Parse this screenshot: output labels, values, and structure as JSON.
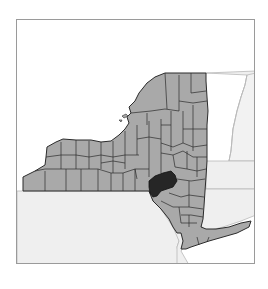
{
  "map": {
    "title": "New York State counties locator map",
    "state": "New York",
    "highlighted_region": "Delaware County",
    "neighbor_regions": [
      "Pennsylvania",
      "New Jersey",
      "Vermont",
      "Massachusetts",
      "Connecticut"
    ],
    "colors": {
      "background": "#ffffff",
      "frame_border": "#9a9a9a",
      "state_fill": "#a9a9a9",
      "county_border": "#2b2b2b",
      "highlight_fill": "#262626",
      "neighbor_fill": "#efefef",
      "neighbor_border": "#b9b9b9",
      "water": "#ffffff"
    }
  }
}
